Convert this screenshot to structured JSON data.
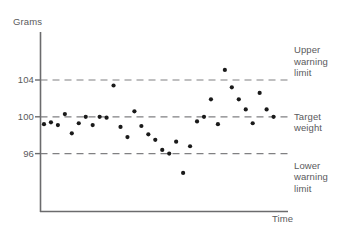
{
  "chart_data": {
    "type": "scatter",
    "title": "",
    "subtitle": "",
    "xlabel": "Time",
    "ylabel": "Grams",
    "ylim": [
      92,
      108
    ],
    "xlim": [
      0,
      40
    ],
    "grid": false,
    "legend_position": "right-outside",
    "y_ticks": [
      {
        "label": "104",
        "value": 104
      },
      {
        "label": "100",
        "value": 100
      },
      {
        "label": "96",
        "value": 96
      }
    ],
    "x_ticks": [],
    "reference_lines": [
      {
        "name": "upper-warning-limit",
        "value": 104,
        "label": "Upper\nwarning\nlimit",
        "style": "dashed"
      },
      {
        "name": "target-weight",
        "value": 100,
        "label": "Target\nweight",
        "style": "dashed"
      },
      {
        "name": "lower-warning-limit",
        "value": 96,
        "label": "Lower\nwarning\nlimit",
        "style": "dashed"
      }
    ],
    "annotations": [
      {
        "id": "upper",
        "lines": [
          "Upper",
          "warning",
          "limit"
        ],
        "at_value": 104
      },
      {
        "id": "target",
        "lines": [
          "Target",
          "weight"
        ],
        "at_value": 100
      },
      {
        "id": "lower",
        "lines": [
          "Lower",
          "warning",
          "limit"
        ],
        "at_value": 96
      }
    ],
    "series": [
      {
        "name": "Sample weight",
        "marker": "circle",
        "color": "#1a1a1a",
        "points": [
          {
            "x": 1,
            "y": 99.2
          },
          {
            "x": 2,
            "y": 99.4
          },
          {
            "x": 3,
            "y": 99.1
          },
          {
            "x": 4,
            "y": 100.3
          },
          {
            "x": 5,
            "y": 98.2
          },
          {
            "x": 6,
            "y": 99.3
          },
          {
            "x": 7,
            "y": 100.0
          },
          {
            "x": 8,
            "y": 99.1
          },
          {
            "x": 9,
            "y": 100.0
          },
          {
            "x": 10,
            "y": 99.9
          },
          {
            "x": 11,
            "y": 103.4
          },
          {
            "x": 12,
            "y": 98.9
          },
          {
            "x": 13,
            "y": 97.8
          },
          {
            "x": 14,
            "y": 100.6
          },
          {
            "x": 15,
            "y": 99.0
          },
          {
            "x": 16,
            "y": 98.1
          },
          {
            "x": 17,
            "y": 97.5
          },
          {
            "x": 18,
            "y": 96.4
          },
          {
            "x": 19,
            "y": 96.0
          },
          {
            "x": 20,
            "y": 97.3
          },
          {
            "x": 21,
            "y": 93.9
          },
          {
            "x": 22,
            "y": 96.8
          },
          {
            "x": 23,
            "y": 99.5
          },
          {
            "x": 24,
            "y": 100.0
          },
          {
            "x": 25,
            "y": 101.9
          },
          {
            "x": 26,
            "y": 99.2
          },
          {
            "x": 27,
            "y": 105.1
          },
          {
            "x": 28,
            "y": 103.2
          },
          {
            "x": 29,
            "y": 101.9
          },
          {
            "x": 30,
            "y": 100.8
          },
          {
            "x": 31,
            "y": 99.3
          },
          {
            "x": 32,
            "y": 102.6
          },
          {
            "x": 33,
            "y": 100.8
          },
          {
            "x": 34,
            "y": 100.0
          }
        ]
      }
    ]
  },
  "axes": {
    "y_title": "Grams",
    "x_title": "Time"
  }
}
